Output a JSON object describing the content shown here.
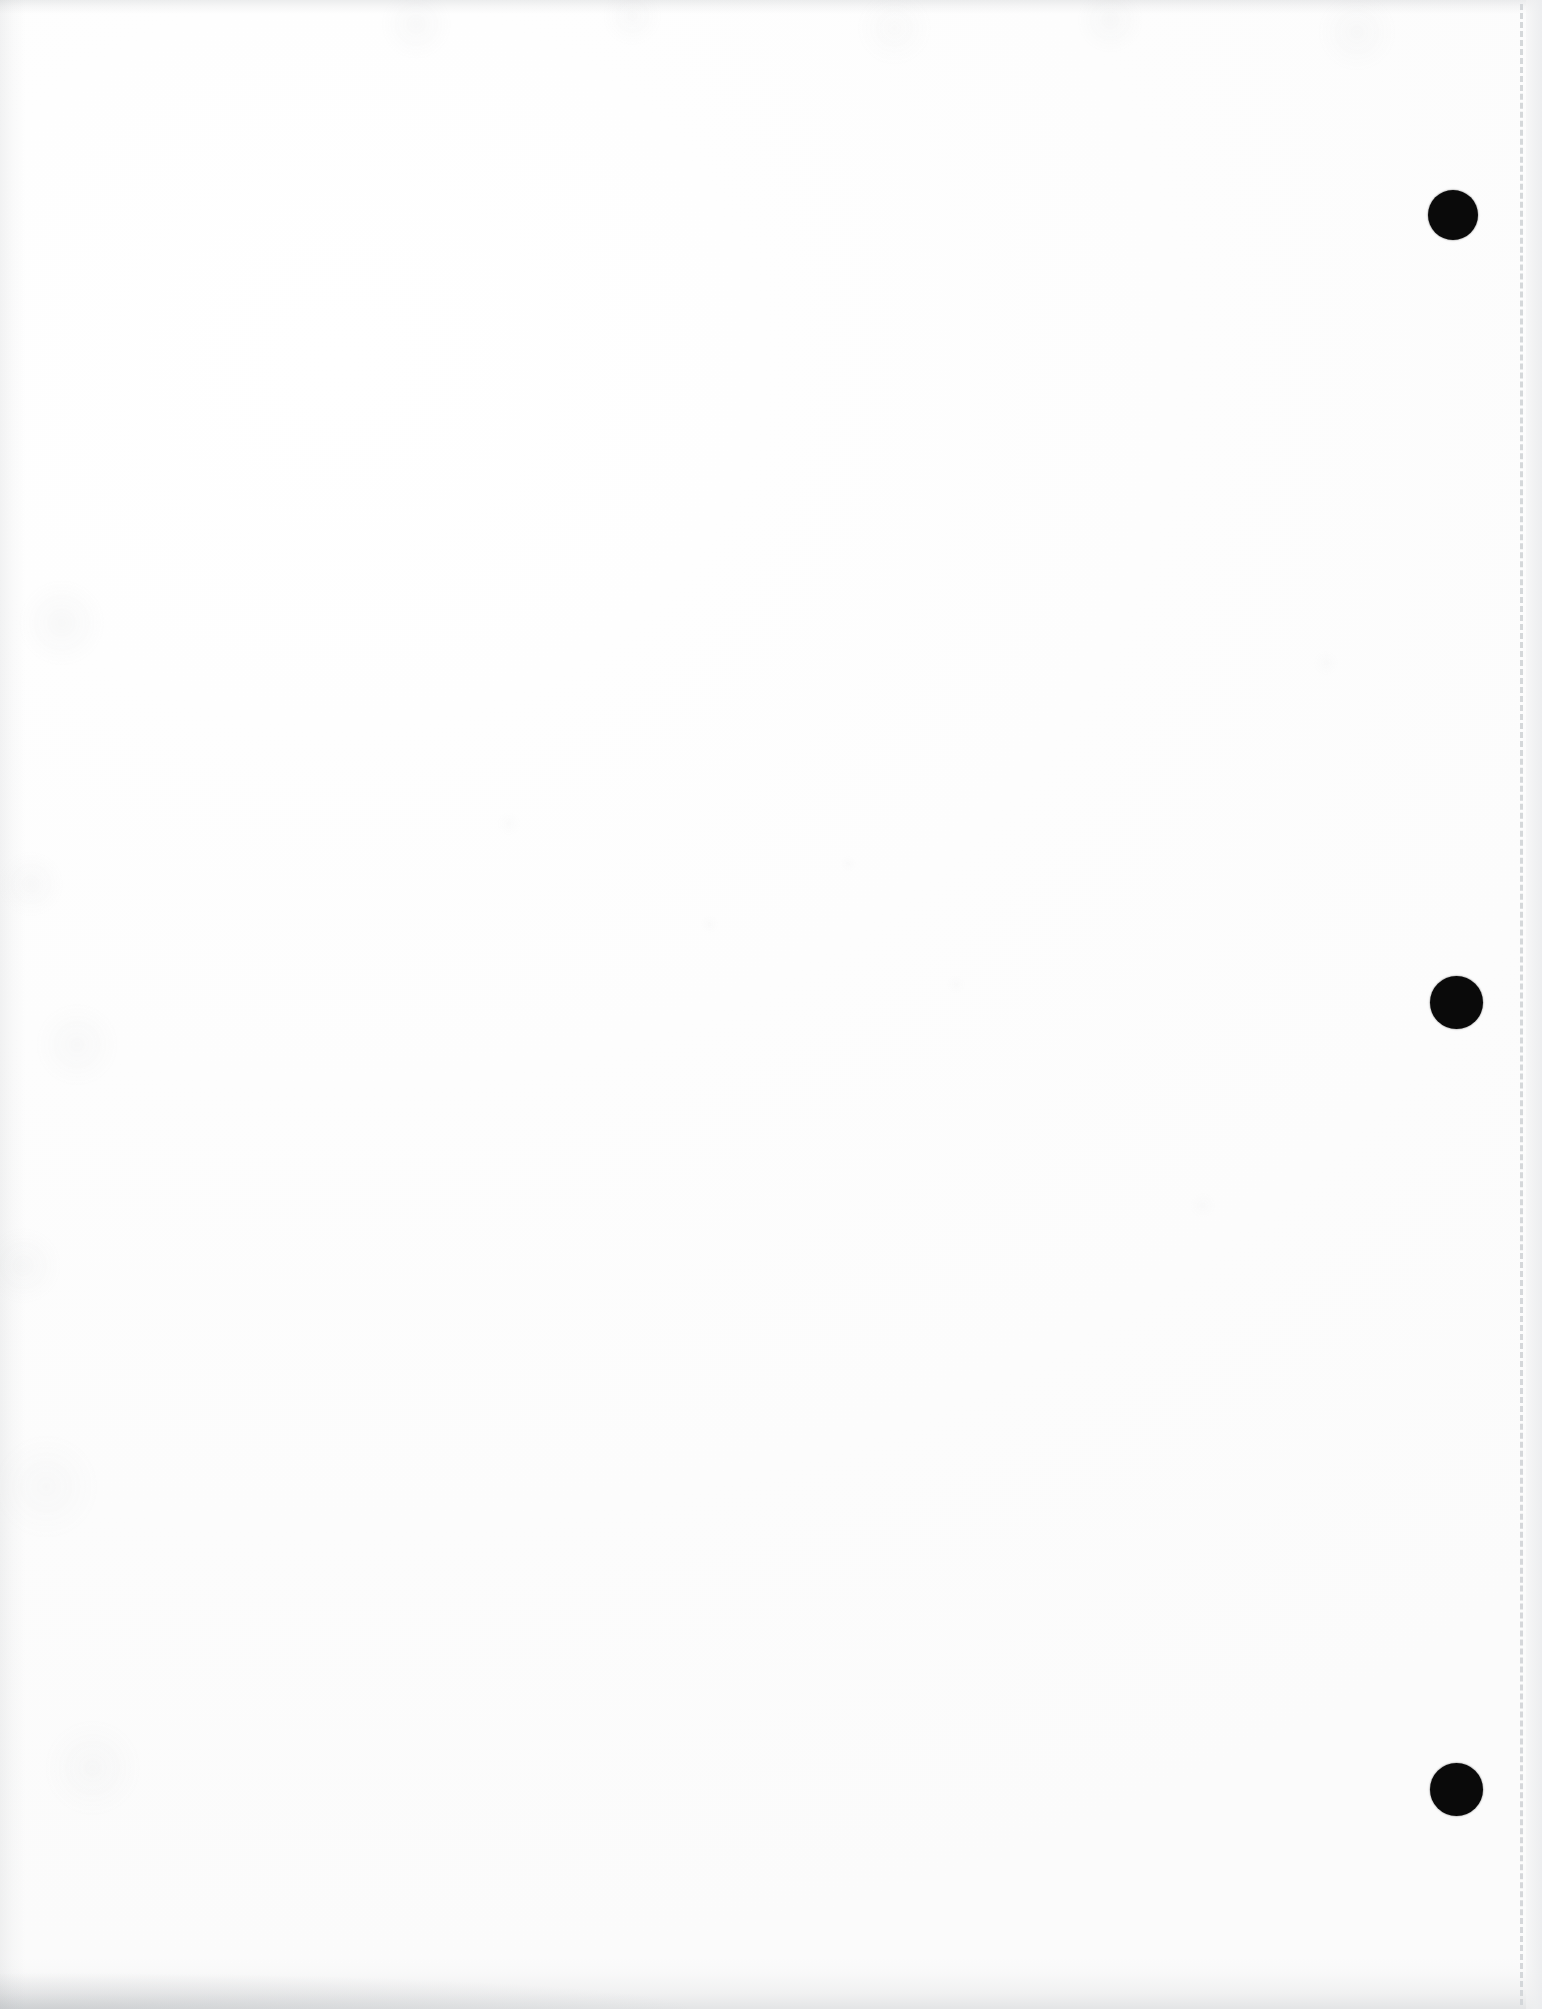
{
  "page": {
    "kind": "scanned-document-page",
    "width_px": 1542,
    "height_px": 2009,
    "background_color": "#fefefe",
    "text_content": "",
    "body_text": ""
  },
  "marks": {
    "registration_dots": [
      {
        "name": "registration-dot-top",
        "x": 1428,
        "y": 190,
        "diameter": 50,
        "color": "#0a0a0a"
      },
      {
        "name": "registration-dot-middle",
        "x": 1430,
        "y": 976,
        "diameter": 53,
        "color": "#0a0a0a"
      },
      {
        "name": "registration-dot-bottom",
        "x": 1430,
        "y": 1763,
        "diameter": 53,
        "color": "#0a0a0a"
      }
    ],
    "perforation_line": {
      "name": "dashed-perforation-line",
      "x": 1520,
      "color": "#d2d5d8",
      "style": "dashed",
      "width": 3
    }
  },
  "edges": {
    "top_smudge_color": "#8c9196",
    "bottom_smudge_color": "#878c92",
    "left_smudge_color": "#8c9196",
    "right_margin_color": "#eceded"
  }
}
